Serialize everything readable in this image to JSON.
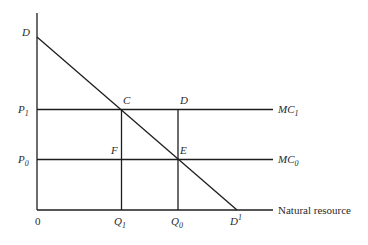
{
  "diagram": {
    "axes": {
      "origin_label": "0",
      "x_axis_label": "Natural resource"
    },
    "labels": {
      "demand_intercept": "D",
      "demand_end": {
        "base": "D",
        "sup": "1"
      },
      "p1": {
        "base": "P",
        "sub": "1"
      },
      "p0": {
        "base": "P",
        "sub": "0"
      },
      "q1": {
        "base": "Q",
        "sub": "1"
      },
      "q0": {
        "base": "Q",
        "sub": "0"
      },
      "mc1": {
        "base": "MC",
        "sub": "1"
      },
      "mc0": {
        "base": "MC",
        "sub": "0"
      },
      "point_c": "C",
      "point_d": "D",
      "point_e": "E",
      "point_f": "F"
    },
    "colors": {
      "line": "#1e1e1e",
      "text": "#2a2a2a",
      "background": "#ffffff"
    }
  }
}
